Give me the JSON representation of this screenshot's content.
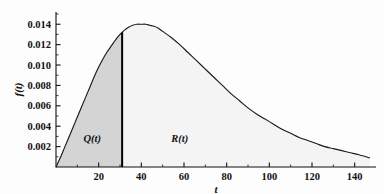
{
  "chart_data": {
    "type": "area",
    "title": "",
    "subtitle": "",
    "xlabel": "t",
    "ylabel": "f(t)",
    "xlim": [
      0,
      150
    ],
    "ylim": [
      0,
      0.0152
    ],
    "grid": false,
    "legend_position": "none",
    "x_ticks": [
      20,
      40,
      60,
      80,
      100,
      120,
      140
    ],
    "x_tick_labels": [
      "20",
      "40",
      "60",
      "80",
      "100",
      "120",
      "140"
    ],
    "x_minor_ticks": [
      10,
      30,
      50,
      70,
      90,
      110,
      130
    ],
    "y_ticks": [
      0.002,
      0.004,
      0.006,
      0.008,
      0.01,
      0.012,
      0.014
    ],
    "y_tick_labels": [
      "0.002",
      "0.004",
      "0.006",
      "0.008",
      "0.010",
      "0.012",
      "0.014"
    ],
    "y_minor_ticks": [
      0.001,
      0.003,
      0.005,
      0.007,
      0.009,
      0.011,
      0.013,
      0.015
    ],
    "series": [
      {
        "name": "f(t)",
        "x": [
          0,
          2,
          4,
          6,
          8,
          10,
          12,
          14,
          16,
          18,
          20,
          22,
          24,
          26,
          28,
          30,
          31,
          32,
          34,
          36,
          38,
          40,
          42,
          44,
          46,
          48,
          50,
          54,
          58,
          62,
          66,
          70,
          74,
          78,
          82,
          86,
          90,
          94,
          98,
          102,
          106,
          110,
          114,
          118,
          122,
          126,
          130,
          134,
          138,
          142,
          147
        ],
        "values": [
          0.0,
          0.0009,
          0.0019,
          0.0029,
          0.0039,
          0.0049,
          0.0059,
          0.0069,
          0.0079,
          0.0089,
          0.0098,
          0.0106,
          0.0113,
          0.0119,
          0.0125,
          0.013,
          0.0132,
          0.0134,
          0.0137,
          0.0139,
          0.014,
          0.014,
          0.014,
          0.0139,
          0.0138,
          0.0136,
          0.0133,
          0.0127,
          0.012,
          0.0112,
          0.0104,
          0.0096,
          0.0088,
          0.008,
          0.0072,
          0.0065,
          0.0058,
          0.0052,
          0.0047,
          0.0042,
          0.0037,
          0.0033,
          0.0029,
          0.0026,
          0.0023,
          0.002,
          0.0018,
          0.0016,
          0.0014,
          0.0012,
          0.0009
        ]
      }
    ],
    "regions": [
      {
        "name": "Q(t)",
        "label": "Q(t)",
        "x_start": 0,
        "x_end": 31,
        "fill": "#d4d4d4",
        "label_x": 17,
        "label_y": 0.0025
      },
      {
        "name": "R(t)",
        "label": "R(t)",
        "x_start": 31,
        "x_end": 147,
        "fill": "#f4f4f4",
        "label_x": 58,
        "label_y": 0.0025
      }
    ],
    "annotations": [
      {
        "name": "divider",
        "type": "vertical-line",
        "x": 31,
        "y_top": 0.0132,
        "color": "#000000"
      }
    ],
    "colors": {
      "curve": "#1a1a1a",
      "axis": "#111111",
      "q_region": "#d4d4d4",
      "r_region": "#f4f4f4",
      "divider": "#000000",
      "background": "#fdfdfd"
    }
  }
}
